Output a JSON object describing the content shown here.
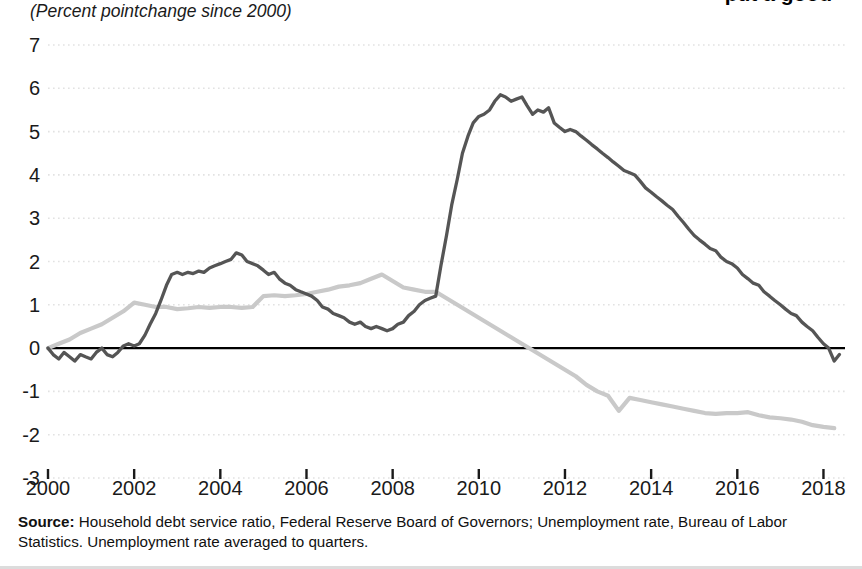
{
  "figure": {
    "title_clipped": "put a good",
    "subtitle": "(Percent  pointchange since 2000)",
    "source_label": "Source:",
    "source_text": " Household debt service ratio, Federal Reserve Board of Governors; Unemployment rate, Bureau of Labor Statistics. Unemployment rate averaged to quarters."
  },
  "colors": {
    "unemployment_line": "#555555",
    "debt_service_line": "#c9c9c9",
    "zero_line": "#000000",
    "gridline": "#e2e2e2",
    "text": "#1a1a1a"
  },
  "chart_data": {
    "type": "line",
    "title": "put a good",
    "subtitle": "(Percent  pointchange since 2000)",
    "xlabel": "",
    "ylabel": "Percent point change since 2000",
    "xlim": [
      2000,
      2018.5
    ],
    "ylim": [
      -3,
      7
    ],
    "grid": true,
    "legend_position": "none",
    "xticks": [
      2000,
      2002,
      2004,
      2006,
      2008,
      2010,
      2012,
      2014,
      2016,
      2018
    ],
    "xtick_labels": [
      "2000",
      "2002",
      "2004",
      "2006",
      "2008",
      "2010",
      "2012",
      "2014",
      "2016",
      "2018"
    ],
    "yticks": [
      -3,
      -2,
      -1,
      0,
      1,
      2,
      3,
      4,
      5,
      6,
      7
    ],
    "ytick_labels": [
      "-3",
      "-2",
      "-1",
      "0",
      "1",
      "2",
      "3",
      "4",
      "5",
      "6",
      "7"
    ],
    "zero_reference_line": 0,
    "series": [
      {
        "name": "Unemployment rate",
        "color": "#555555",
        "x": [
          2000.0,
          2000.12,
          2000.25,
          2000.37,
          2000.5,
          2000.62,
          2000.75,
          2000.87,
          2001.0,
          2001.12,
          2001.25,
          2001.37,
          2001.5,
          2001.62,
          2001.75,
          2001.87,
          2002.0,
          2002.12,
          2002.25,
          2002.37,
          2002.5,
          2002.62,
          2002.75,
          2002.87,
          2003.0,
          2003.12,
          2003.25,
          2003.37,
          2003.5,
          2003.62,
          2003.75,
          2003.87,
          2004.0,
          2004.12,
          2004.25,
          2004.37,
          2004.5,
          2004.62,
          2004.75,
          2004.87,
          2005.0,
          2005.12,
          2005.25,
          2005.37,
          2005.5,
          2005.62,
          2005.75,
          2005.87,
          2006.0,
          2006.12,
          2006.25,
          2006.37,
          2006.5,
          2006.62,
          2006.75,
          2006.87,
          2007.0,
          2007.12,
          2007.25,
          2007.37,
          2007.5,
          2007.62,
          2007.75,
          2007.87,
          2008.0,
          2008.12,
          2008.25,
          2008.37,
          2008.5,
          2008.62,
          2008.75,
          2008.87,
          2009.0,
          2009.12,
          2009.25,
          2009.37,
          2009.5,
          2009.62,
          2009.75,
          2009.87,
          2010.0,
          2010.12,
          2010.25,
          2010.37,
          2010.5,
          2010.62,
          2010.75,
          2010.87,
          2011.0,
          2011.12,
          2011.25,
          2011.37,
          2011.5,
          2011.62,
          2011.75,
          2011.87,
          2012.0,
          2012.12,
          2012.25,
          2012.37,
          2012.5,
          2012.62,
          2012.75,
          2012.87,
          2013.0,
          2013.12,
          2013.25,
          2013.37,
          2013.5,
          2013.62,
          2013.75,
          2013.87,
          2014.0,
          2014.12,
          2014.25,
          2014.37,
          2014.5,
          2014.62,
          2014.75,
          2014.87,
          2015.0,
          2015.12,
          2015.25,
          2015.37,
          2015.5,
          2015.62,
          2015.75,
          2015.87,
          2016.0,
          2016.12,
          2016.25,
          2016.37,
          2016.5,
          2016.62,
          2016.75,
          2016.87,
          2017.0,
          2017.12,
          2017.25,
          2017.37,
          2017.5,
          2017.62,
          2017.75,
          2017.87,
          2018.0,
          2018.12,
          2018.25,
          2018.37
        ],
        "y": [
          0.0,
          -0.15,
          -0.25,
          -0.1,
          -0.2,
          -0.3,
          -0.15,
          -0.2,
          -0.25,
          -0.1,
          0.0,
          -0.15,
          -0.2,
          -0.1,
          0.05,
          0.1,
          0.05,
          0.1,
          0.3,
          0.55,
          0.8,
          1.1,
          1.45,
          1.7,
          1.75,
          1.7,
          1.75,
          1.72,
          1.78,
          1.75,
          1.85,
          1.9,
          1.95,
          2.0,
          2.05,
          2.2,
          2.15,
          2.0,
          1.95,
          1.9,
          1.8,
          1.7,
          1.75,
          1.6,
          1.5,
          1.45,
          1.35,
          1.3,
          1.25,
          1.2,
          1.1,
          0.95,
          0.9,
          0.8,
          0.75,
          0.7,
          0.6,
          0.55,
          0.6,
          0.5,
          0.45,
          0.5,
          0.45,
          0.4,
          0.45,
          0.55,
          0.6,
          0.75,
          0.85,
          1.0,
          1.1,
          1.15,
          1.2,
          1.9,
          2.6,
          3.3,
          3.9,
          4.5,
          4.9,
          5.2,
          5.35,
          5.4,
          5.5,
          5.7,
          5.85,
          5.8,
          5.7,
          5.75,
          5.8,
          5.6,
          5.4,
          5.5,
          5.45,
          5.55,
          5.2,
          5.1,
          5.0,
          5.05,
          5.0,
          4.9,
          4.8,
          4.7,
          4.6,
          4.5,
          4.4,
          4.3,
          4.2,
          4.1,
          4.05,
          4.0,
          3.85,
          3.7,
          3.6,
          3.5,
          3.4,
          3.3,
          3.2,
          3.05,
          2.9,
          2.75,
          2.6,
          2.5,
          2.4,
          2.3,
          2.25,
          2.1,
          2.0,
          1.95,
          1.85,
          1.7,
          1.6,
          1.5,
          1.45,
          1.3,
          1.2,
          1.1,
          1.0,
          0.9,
          0.8,
          0.75,
          0.6,
          0.5,
          0.4,
          0.25,
          0.1,
          0.0,
          -0.3,
          -0.15
        ]
      },
      {
        "name": "Household debt service ratio",
        "color": "#c9c9c9",
        "x": [
          2000.0,
          2000.25,
          2000.5,
          2000.75,
          2001.0,
          2001.25,
          2001.5,
          2001.75,
          2002.0,
          2002.25,
          2002.5,
          2002.75,
          2003.0,
          2003.25,
          2003.5,
          2003.75,
          2004.0,
          2004.25,
          2004.5,
          2004.75,
          2005.0,
          2005.25,
          2005.5,
          2005.75,
          2006.0,
          2006.25,
          2006.5,
          2006.75,
          2007.0,
          2007.25,
          2007.5,
          2007.75,
          2008.0,
          2008.25,
          2008.5,
          2008.75,
          2009.0,
          2009.25,
          2009.5,
          2009.75,
          2010.0,
          2010.25,
          2010.5,
          2010.75,
          2011.0,
          2011.25,
          2011.5,
          2011.75,
          2012.0,
          2012.25,
          2012.5,
          2012.75,
          2013.0,
          2013.25,
          2013.5,
          2013.75,
          2014.0,
          2014.25,
          2014.5,
          2014.75,
          2015.0,
          2015.25,
          2015.5,
          2015.75,
          2016.0,
          2016.25,
          2016.5,
          2016.75,
          2017.0,
          2017.25,
          2017.5,
          2017.75,
          2018.0,
          2018.25
        ],
        "y": [
          0.0,
          0.1,
          0.2,
          0.35,
          0.45,
          0.55,
          0.7,
          0.85,
          1.05,
          1.0,
          0.95,
          0.95,
          0.9,
          0.92,
          0.95,
          0.93,
          0.95,
          0.95,
          0.93,
          0.95,
          1.2,
          1.22,
          1.2,
          1.22,
          1.25,
          1.3,
          1.35,
          1.42,
          1.45,
          1.5,
          1.6,
          1.7,
          1.55,
          1.4,
          1.35,
          1.3,
          1.3,
          1.15,
          1.0,
          0.85,
          0.7,
          0.55,
          0.4,
          0.25,
          0.1,
          -0.05,
          -0.2,
          -0.35,
          -0.5,
          -0.65,
          -0.85,
          -1.0,
          -1.1,
          -1.45,
          -1.15,
          -1.2,
          -1.25,
          -1.3,
          -1.35,
          -1.4,
          -1.45,
          -1.5,
          -1.52,
          -1.5,
          -1.5,
          -1.48,
          -1.55,
          -1.6,
          -1.62,
          -1.65,
          -1.7,
          -1.78,
          -1.82,
          -1.85
        ]
      }
    ]
  }
}
